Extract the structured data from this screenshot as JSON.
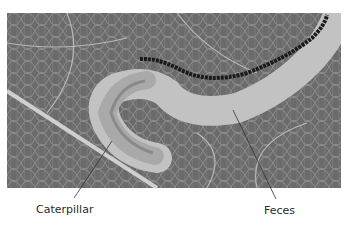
{
  "figure": {
    "labels": [
      {
        "id": "caterpillar",
        "text": "Caterpillar"
      },
      {
        "id": "feces",
        "text": "Feces"
      }
    ],
    "colors": {
      "leaf": "#6e6e6e",
      "veins": "#c8c8c8",
      "mine": "#bdbdbd",
      "frass": "#1e1e1e",
      "caterpillar": "#9a9a9a"
    }
  }
}
